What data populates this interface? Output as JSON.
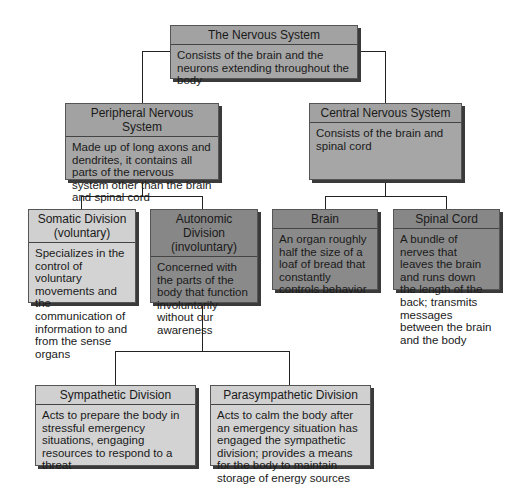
{
  "diagram": {
    "root": {
      "title": "The Nervous System",
      "description": "Consists of the brain and the neurons extending throughout the body"
    },
    "peripheral": {
      "title": "Peripheral Nervous System",
      "description": "Made up of long axons and dendrites, it contains all parts of the nervous system other than the brain and spinal cord"
    },
    "central": {
      "title": "Central Nervous System",
      "description": "Consists of the brain and spinal cord"
    },
    "somatic": {
      "title": "Somatic Division (voluntary)",
      "description": "Specializes in the control of voluntary movements and the communication of information to and from the sense organs"
    },
    "autonomic": {
      "title": "Autonomic Division (involuntary)",
      "description": "Concerned with the parts of the body that function involuntarily without our awareness"
    },
    "brain": {
      "title": "Brain",
      "description": "An organ roughly half the size of a loaf of bread that constantly controls behavior"
    },
    "spinal_cord": {
      "title": "Spinal Cord",
      "description": "A bundle of nerves that leaves the brain and runs down the length of the back; transmits messages between the brain and the body"
    },
    "sympathetic": {
      "title": "Sympathetic Division",
      "description": "Acts to prepare the body in stressful emergency situations, engaging resources to respond to a threat"
    },
    "parasympathetic": {
      "title": "Parasympathetic Division",
      "description": "Acts to calm the body after an emergency situation has engaged the sympathetic division; provides a means for the body to maintain storage of energy sources"
    },
    "colors": {
      "light": "#d3d3d3",
      "medium": "#a6a6a6",
      "dark": "#8a8a8a",
      "line": "#222222"
    }
  }
}
